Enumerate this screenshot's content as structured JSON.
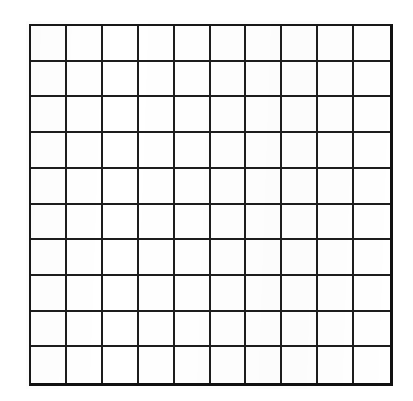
{
  "document": {
    "kind": "blank-grid-worksheet",
    "title": "Blank 10 by 10 Grid",
    "background_color": "#ffffff",
    "has_text_labels": false,
    "has_axis_labels": false,
    "has_legend": false,
    "has_title_text": false
  },
  "grid": {
    "rows": 10,
    "columns": 10,
    "total_cells": 100,
    "cell_fill_color": "#ffffff",
    "line_color": "#1d1d1d",
    "outer_border_color": "#111111",
    "interior_line_width_px": 2,
    "outer_border_width_px": 3,
    "bounds": {
      "left_px": 29,
      "top_px": 24,
      "width_px": 364,
      "height_px": 362
    },
    "cell_size": {
      "width_px": 36.4,
      "height_px": 36.2
    },
    "cells": [
      [
        "",
        "",
        "",
        "",
        "",
        "",
        "",
        "",
        "",
        ""
      ],
      [
        "",
        "",
        "",
        "",
        "",
        "",
        "",
        "",
        "",
        ""
      ],
      [
        "",
        "",
        "",
        "",
        "",
        "",
        "",
        "",
        "",
        ""
      ],
      [
        "",
        "",
        "",
        "",
        "",
        "",
        "",
        "",
        "",
        ""
      ],
      [
        "",
        "",
        "",
        "",
        "",
        "",
        "",
        "",
        "",
        ""
      ],
      [
        "",
        "",
        "",
        "",
        "",
        "",
        "",
        "",
        "",
        ""
      ],
      [
        "",
        "",
        "",
        "",
        "",
        "",
        "",
        "",
        "",
        ""
      ],
      [
        "",
        "",
        "",
        "",
        "",
        "",
        "",
        "",
        "",
        ""
      ],
      [
        "",
        "",
        "",
        "",
        "",
        "",
        "",
        "",
        "",
        ""
      ],
      [
        "",
        "",
        "",
        "",
        "",
        "",
        "",
        "",
        "",
        ""
      ]
    ]
  }
}
